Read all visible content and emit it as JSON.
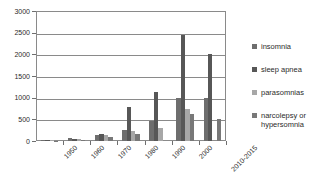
{
  "chart_data": {
    "type": "bar",
    "title": "",
    "xlabel": "",
    "ylabel": "",
    "ylim": [
      0,
      3000
    ],
    "ytick_values": [
      3000,
      2500,
      2000,
      1500,
      1000,
      500,
      0
    ],
    "ytick_labels": [
      "3000",
      "2500",
      "2000",
      "1500",
      "1000",
      "500",
      "0"
    ],
    "grid": true,
    "legend_position": "right",
    "categories": [
      "1950",
      "1960",
      "1970",
      "1980",
      "1990",
      "2000",
      "2010-2015"
    ],
    "series": [
      {
        "name": "insomnia",
        "color": "#6e6e6e",
        "values": [
          20,
          70,
          145,
          250,
          460,
          1000,
          1000
        ]
      },
      {
        "name": "sleep apnea",
        "color": "#575757",
        "values": [
          25,
          45,
          165,
          780,
          1120,
          2450,
          2000
        ]
      },
      {
        "name": "parasomnias",
        "color": "#a7a7a7",
        "values": [
          20,
          55,
          140,
          220,
          290,
          750,
          0
        ]
      },
      {
        "name": "narcolepsy or hypersomnia",
        "color": "#787878",
        "values": [
          10,
          30,
          100,
          160,
          0,
          620,
          500
        ]
      }
    ]
  },
  "legend": {
    "items": [
      {
        "label": "insomnia"
      },
      {
        "label": "sleep apnea"
      },
      {
        "label": "parasomnias"
      },
      {
        "label": "narcolepsy or hypersomnia"
      }
    ]
  }
}
